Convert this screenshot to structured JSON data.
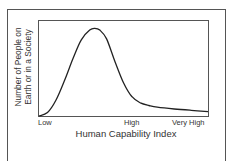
{
  "chart_data": {
    "type": "line",
    "title": "",
    "xlabel": "Human Capability Index",
    "ylabel": "Number of People on Earth or in a Society",
    "ylabel_lines": [
      "Number of People on",
      "Earth or in a Society"
    ],
    "x_tick_labels": [
      "Low",
      "High",
      "Very High"
    ],
    "x_tick_positions": [
      0,
      0.55,
      1.0
    ],
    "grid": false,
    "legend": null,
    "series": [
      {
        "name": "distribution",
        "x": [
          0.0,
          0.05,
          0.1,
          0.15,
          0.2,
          0.25,
          0.3,
          0.33,
          0.36,
          0.4,
          0.45,
          0.5,
          0.55,
          0.6,
          0.65,
          0.7,
          0.8,
          0.9,
          1.0
        ],
        "y": [
          0.0,
          0.04,
          0.18,
          0.4,
          0.65,
          0.87,
          0.98,
          1.0,
          0.98,
          0.88,
          0.62,
          0.38,
          0.22,
          0.15,
          0.12,
          0.1,
          0.08,
          0.065,
          0.05
        ]
      }
    ],
    "ylim": [
      0,
      1.05
    ],
    "xlim": [
      0,
      1
    ]
  },
  "axis": {
    "ylabel_line1": "Number of People on",
    "ylabel_line2": "Earth or in a Society",
    "xlabel": "Human Capability Index",
    "tick_low": "Low",
    "tick_high": "High",
    "tick_very_high": "Very High"
  },
  "colors": {
    "curve": "#222222",
    "axis": "#444444",
    "frame": "#555555"
  }
}
